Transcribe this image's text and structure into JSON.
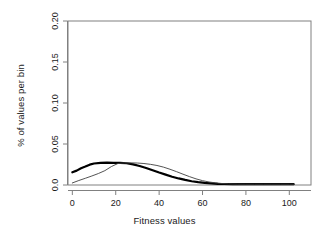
{
  "chart_data": {
    "type": "line",
    "title": "",
    "subtitle": "",
    "xlabel": "Fitness values",
    "ylabel": "% of values per bin",
    "xlim": [
      -2,
      110
    ],
    "ylim": [
      0.0,
      0.2
    ],
    "xticks": [
      0,
      20,
      40,
      60,
      80,
      100
    ],
    "xticklabels": [
      "0",
      "20",
      "40",
      "60",
      "80",
      "100"
    ],
    "yticks": [
      0.0,
      0.05,
      0.1,
      0.15,
      0.2
    ],
    "yticklabels": [
      "0.0",
      "0.05",
      "0.10",
      "0.15",
      "0.20"
    ],
    "grid": false,
    "legend": null,
    "box": true,
    "series": [
      {
        "name": "thick-curve",
        "color": "#000000",
        "linewidth": 2.2,
        "x": [
          0,
          2,
          4,
          6,
          8,
          10,
          13,
          16,
          19,
          22,
          25,
          28,
          31,
          34,
          37,
          40,
          43,
          46,
          49,
          52,
          55,
          58,
          61,
          64,
          67,
          70,
          74,
          78,
          82,
          86,
          90,
          94,
          98,
          102
        ],
        "y": [
          0.0155,
          0.0175,
          0.0205,
          0.0225,
          0.0248,
          0.0262,
          0.027,
          0.0272,
          0.0271,
          0.027,
          0.0265,
          0.0252,
          0.0232,
          0.0207,
          0.018,
          0.0152,
          0.0126,
          0.0101,
          0.008,
          0.0062,
          0.0046,
          0.0034,
          0.0025,
          0.0019,
          0.0014,
          0.0012,
          0.001,
          0.001,
          0.001,
          0.001,
          0.001,
          0.001,
          0.001,
          0.001
        ]
      },
      {
        "name": "thin-curve",
        "color": "#3f3f3f",
        "linewidth": 0.9,
        "x": [
          0,
          3,
          6,
          9,
          12,
          15,
          18,
          21,
          24,
          27,
          30,
          33,
          36,
          39,
          42,
          45,
          48,
          51,
          54,
          57,
          60,
          63,
          66,
          69,
          72,
          76,
          80,
          84,
          88,
          92,
          96,
          100,
          102
        ],
        "y": [
          0.0025,
          0.0055,
          0.0082,
          0.011,
          0.014,
          0.0175,
          0.0225,
          0.0262,
          0.027,
          0.027,
          0.0268,
          0.0262,
          0.0252,
          0.0238,
          0.0218,
          0.0192,
          0.0163,
          0.0132,
          0.0102,
          0.0075,
          0.0053,
          0.0037,
          0.0026,
          0.0018,
          0.0014,
          0.0011,
          0.001,
          0.001,
          0.001,
          0.001,
          0.001,
          0.001,
          0.001
        ]
      }
    ]
  }
}
